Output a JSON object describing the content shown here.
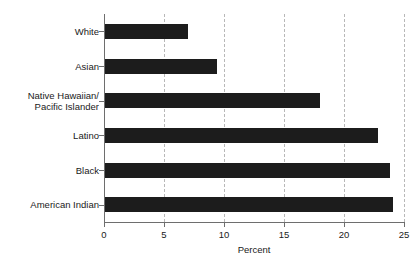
{
  "chart_data": {
    "type": "bar",
    "orientation": "horizontal",
    "title": "",
    "xlabel": "Percent",
    "ylabel": "",
    "categories": [
      "White",
      "Asian",
      "Native Hawaiian/\nPacific Islander",
      "Latino",
      "Black",
      "American Indian"
    ],
    "values": [
      7.0,
      9.4,
      18.0,
      22.8,
      23.8,
      24.1
    ],
    "xlim": [
      0,
      25
    ],
    "xticks": [
      0,
      5,
      10,
      15,
      20,
      25
    ],
    "xtick_labels": [
      "0",
      "5",
      "10",
      "15",
      "20",
      "25"
    ],
    "grid": "vertical-dashed",
    "legend": "none",
    "bar_color": "#1c1c1c",
    "grid_color": "#b8b8b8",
    "axis_color": "#6e6e6e",
    "background_color": "#ffffff"
  }
}
